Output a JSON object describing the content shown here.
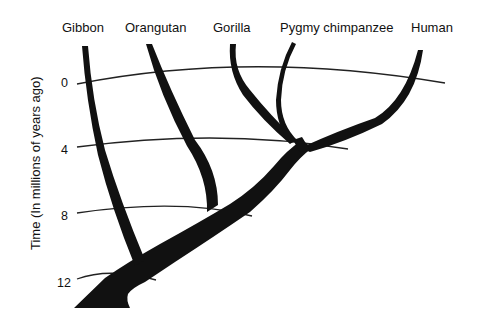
{
  "diagram": {
    "type": "phylogenetic-tree",
    "species": [
      {
        "name": "Gibbon",
        "x": 84
      },
      {
        "name": "Orangutan",
        "x": 157
      },
      {
        "name": "Gorilla",
        "x": 232
      },
      {
        "name": "Pygmy chimpanzee",
        "x": 342
      },
      {
        "name": "Human",
        "x": 423
      }
    ],
    "axis": {
      "label": "Time (In millions of years ago)",
      "ticks": [
        "0",
        "4",
        "8",
        "12"
      ]
    },
    "colors": {
      "branch": "#111111",
      "line": "#222222",
      "background": "#ffffff"
    }
  }
}
